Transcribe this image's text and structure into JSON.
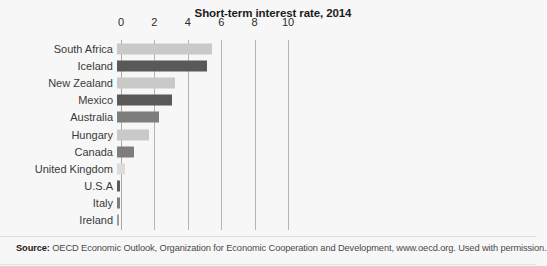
{
  "chart_data": {
    "type": "bar",
    "orientation": "horizontal",
    "title": "Short-term interest rate, 2014",
    "xlabel": "",
    "ylabel": "",
    "xlim": [
      0,
      10
    ],
    "xticks": [
      0,
      2,
      4,
      6,
      8,
      10
    ],
    "xtick_labels": [
      "0",
      "2",
      "4",
      "6",
      "8",
      "10"
    ],
    "grid": true,
    "legend": "none",
    "categories": [
      "South Africa",
      "Iceland",
      "New Zealand",
      "Mexico",
      "Australia",
      "Hungary",
      "Canada",
      "United Kingdom",
      "U.S.A",
      "Italy",
      "Ireland"
    ],
    "values": [
      5.7,
      5.4,
      3.5,
      3.3,
      2.5,
      1.9,
      1.0,
      0.5,
      0.2,
      0.15,
      0.1
    ],
    "bar_colors": [
      "#c9c9c9",
      "#595959",
      "#c9c9c9",
      "#595959",
      "#7d7d7d",
      "#c9c9c9",
      "#7d7d7d",
      "#dcdcdc",
      "#595959",
      "#7d7d7d",
      "#9e9e9e"
    ]
  },
  "footnote": {
    "source_label": "Source:",
    "source_text": " OECD Economic Outlook, Organization for Economic Cooperation and Development, www.oecd.org. Used with permission."
  },
  "colors": {
    "background": "#f7f7f7",
    "gridline": "#b4b4b4",
    "title_color": "#1c1c1c",
    "label_color": "#3a3a3a"
  }
}
